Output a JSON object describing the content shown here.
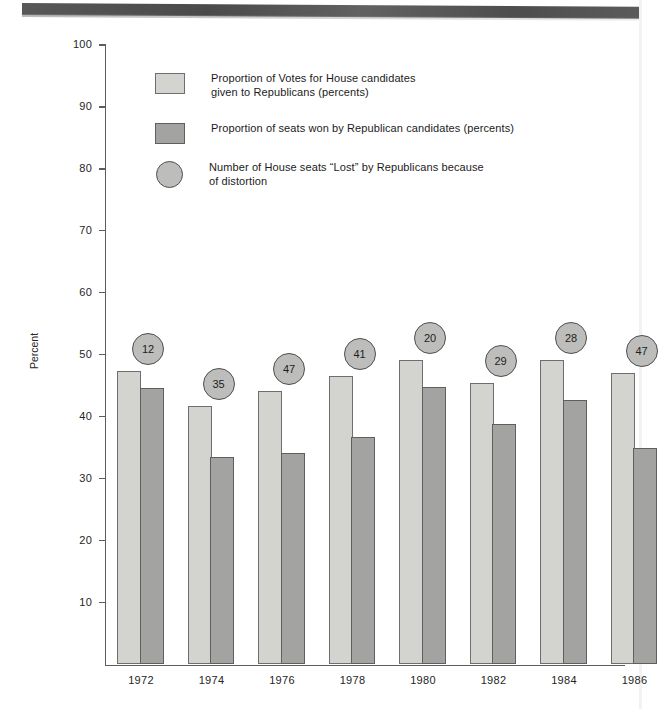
{
  "chart_data": {
    "type": "bar",
    "title": "",
    "xlabel": "",
    "ylabel": "Percent",
    "ylim": [
      0,
      100
    ],
    "ytick_step": 10,
    "grid": false,
    "legend_position": "upper-left-inside",
    "categories": [
      "1972",
      "1974",
      "1976",
      "1978",
      "1980",
      "1982",
      "1984",
      "1986"
    ],
    "series": [
      {
        "name": "Proportion of Votes for House candidates\ngiven to Republicans (percents)",
        "swatch": "light",
        "color": "#d3d3d0",
        "values": [
          47.3,
          41.8,
          44.2,
          46.5,
          49.2,
          45.5,
          49.2,
          47.0
        ]
      },
      {
        "name": "Proportion of seats won by Republican candidates (percents)",
        "swatch": "dark",
        "color": "#a3a3a1",
        "values": [
          44.7,
          33.5,
          34.2,
          36.8,
          44.8,
          38.9,
          42.7,
          35.0
        ]
      },
      {
        "name": "Number of House seats “Lost” by Republicans  because\nof distortion",
        "swatch": "circle",
        "color": "#bdbdbb",
        "values": [
          12,
          35,
          47,
          41,
          20,
          29,
          28,
          47
        ]
      }
    ],
    "ytick_labels": [
      "100",
      "90",
      "80",
      "70",
      "60",
      "50",
      "40",
      "30",
      "20",
      "10"
    ],
    "annotations": [
      {
        "label": "12",
        "category": "1972"
      },
      {
        "label": "35",
        "category": "1974"
      },
      {
        "label": "47",
        "category": "1976"
      },
      {
        "label": "41",
        "category": "1978"
      },
      {
        "label": "20",
        "category": "1980"
      },
      {
        "label": "29",
        "category": "1982"
      },
      {
        "label": "28",
        "category": "1984"
      },
      {
        "label": "47",
        "category": "1986"
      }
    ]
  },
  "axis": {
    "y_label": "Percent"
  },
  "legend": {
    "items": [
      {
        "label": "Proportion of Votes for House candidates\ngiven to Republicans (percents)",
        "swatch": "light"
      },
      {
        "label": "Proportion of seats won by Republican candidates (percents)",
        "swatch": "dark"
      },
      {
        "label": "Number of House seats “Lost” by Republicans  because\nof distortion",
        "swatch": "circle"
      }
    ]
  }
}
